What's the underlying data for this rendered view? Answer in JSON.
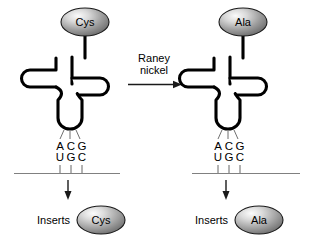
{
  "figure": {
    "background_color": "#ffffff",
    "stroke_color": "#000000",
    "mrna_color": "#808080",
    "oval_fill_light": "#f2f2f2",
    "oval_fill_dark": "#6e6e6e"
  },
  "reaction": {
    "label_line1": "Raney",
    "label_line2": "nickel",
    "arrow": "right-arrow"
  },
  "panels": [
    {
      "id": "left",
      "amino_acid_attached": "Cys",
      "anticodon": [
        "A",
        "C",
        "G"
      ],
      "codon": [
        "U",
        "G",
        "C"
      ],
      "inserts_label": "Inserts",
      "inserts_amino_acid": "Cys"
    },
    {
      "id": "right",
      "amino_acid_attached": "Ala",
      "anticodon": [
        "A",
        "C",
        "G"
      ],
      "codon": [
        "U",
        "G",
        "C"
      ],
      "inserts_label": "Inserts",
      "inserts_amino_acid": "Ala"
    }
  ]
}
